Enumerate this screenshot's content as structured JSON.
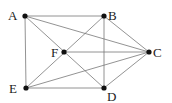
{
  "graph": {
    "nodes": [
      {
        "id": "A",
        "label": "A",
        "x": 25,
        "y": 16,
        "lx": 8,
        "ly": 20
      },
      {
        "id": "B",
        "label": "B",
        "x": 104,
        "y": 16,
        "lx": 108,
        "ly": 20
      },
      {
        "id": "C",
        "label": "C",
        "x": 149,
        "y": 52,
        "lx": 153,
        "ly": 57
      },
      {
        "id": "D",
        "label": "D",
        "x": 104,
        "y": 88,
        "lx": 107,
        "ly": 101
      },
      {
        "id": "E",
        "label": "E",
        "x": 26,
        "y": 88,
        "lx": 9,
        "ly": 93
      },
      {
        "id": "F",
        "label": "F",
        "x": 64,
        "y": 52,
        "lx": 51,
        "ly": 57
      }
    ],
    "edges": [
      [
        "A",
        "B"
      ],
      [
        "A",
        "C"
      ],
      [
        "A",
        "E"
      ],
      [
        "A",
        "D"
      ],
      [
        "B",
        "D"
      ],
      [
        "B",
        "C"
      ],
      [
        "B",
        "E"
      ],
      [
        "F",
        "C"
      ],
      [
        "E",
        "D"
      ],
      [
        "E",
        "C"
      ],
      [
        "D",
        "C"
      ]
    ]
  }
}
